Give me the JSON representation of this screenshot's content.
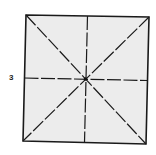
{
  "diagram": {
    "step_number": "3",
    "paper": {
      "fill": "#ececec",
      "stroke": "#1a1a1a",
      "corners": {
        "tl": [
          26,
          15
        ],
        "tr": [
          149,
          17
        ],
        "br": [
          146,
          144
        ],
        "bl": [
          23,
          141
        ]
      }
    },
    "center": [
      85,
      79
    ],
    "fold_lines": [
      {
        "name": "diagonal-tl-br",
        "type": "valley-dashed"
      },
      {
        "name": "diagonal-tr-bl",
        "type": "valley-dashed"
      },
      {
        "name": "vertical-midline",
        "type": "valley-dashed"
      },
      {
        "name": "horizontal-midline",
        "type": "valley-dashed"
      }
    ]
  }
}
